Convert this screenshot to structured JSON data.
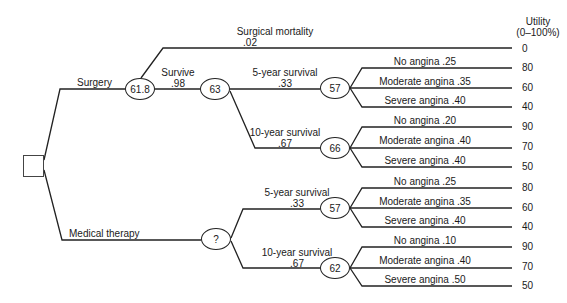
{
  "header": {
    "utility_title": "Utility",
    "utility_range": "(0–100%)"
  },
  "decision": {
    "surgery": "Surgery",
    "medical": "Medical therapy"
  },
  "surgery": {
    "node_value": "61.8",
    "mortality": {
      "label": "Surgical mortality",
      "prob": ".02",
      "utility": "0"
    },
    "survive": {
      "label": "Survive",
      "prob": ".98",
      "node_value": "63"
    },
    "five_year": {
      "label": "5-year survival",
      "prob": ".33",
      "node_value": "57",
      "outcomes": [
        {
          "label": "No angina .25",
          "utility": "80"
        },
        {
          "label": "Moderate angina .35",
          "utility": "60"
        },
        {
          "label": "Severe angina .40",
          "utility": "40"
        }
      ]
    },
    "ten_year": {
      "label": "10-year survival",
      "prob": ".67",
      "node_value": "66",
      "outcomes": [
        {
          "label": "No angina .20",
          "utility": "90"
        },
        {
          "label": "Moderate angina .40",
          "utility": "70"
        },
        {
          "label": "Severe angina .40",
          "utility": "50"
        }
      ]
    }
  },
  "medical": {
    "node_value": "?",
    "five_year": {
      "label": "5-year survival",
      "prob": ".33",
      "node_value": "57",
      "outcomes": [
        {
          "label": "No angina .25",
          "utility": "80"
        },
        {
          "label": "Moderate angina .35",
          "utility": "60"
        },
        {
          "label": "Severe angina .40",
          "utility": "40"
        }
      ]
    },
    "ten_year": {
      "label": "10-year survival",
      "prob": ".67",
      "node_value": "62",
      "outcomes": [
        {
          "label": "No angina .10",
          "utility": "90"
        },
        {
          "label": "Moderate angina .40",
          "utility": "70"
        },
        {
          "label": "Severe angina .50",
          "utility": "50"
        }
      ]
    }
  }
}
